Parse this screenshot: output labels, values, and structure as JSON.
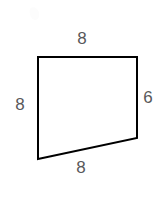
{
  "figure": {
    "kind": "geometry-quadrilateral-diagram",
    "background_color": "#ffffff",
    "stroke_color": "#000000",
    "stroke_width_px": 2,
    "label_color": "#58585a",
    "vertices": [
      {
        "name": "top-left",
        "x": 38,
        "y": 57
      },
      {
        "name": "top-right",
        "x": 137,
        "y": 57
      },
      {
        "name": "bottom-right",
        "x": 137,
        "y": 138
      },
      {
        "name": "bottom-left",
        "x": 38,
        "y": 159
      }
    ],
    "path": "M 38 57 L 137 57 L 137 138 L 38 159 Z",
    "labels": {
      "top": "8",
      "left": "8",
      "right": "6",
      "bottom": "8"
    }
  },
  "chart_data": {
    "type": "table",
    "title": "",
    "categories": [
      "top",
      "left",
      "right",
      "bottom"
    ],
    "values": [
      8,
      8,
      6,
      8
    ],
    "xlabel": "side",
    "ylabel": "length"
  }
}
